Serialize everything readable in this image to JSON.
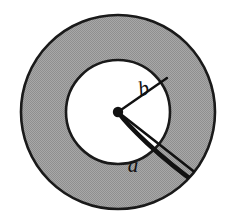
{
  "figure": {
    "name": "annulus-with-radial-crack",
    "background_color": "#ffffff",
    "ring_fill_color": "#9e9e9e",
    "inner_disc_color": "#ffffff",
    "outline_color": "#1a1a1a",
    "line_color": "#111111",
    "center_dot_color": "#111111"
  },
  "geometry": {
    "center": {
      "x": 118,
      "y": 112
    },
    "outer_radius": 97,
    "inner_radius": 52,
    "center_dot_radius": 5.2,
    "outer_stroke_width": 2.6,
    "inner_stroke_width": 2.6,
    "radius_line_stroke_width": 2.4,
    "crack_upper_stroke_width": 2.6,
    "crack_lower_stroke_width": 4.6
  },
  "elements": {
    "outer_circle": {
      "name": "outer-circle"
    },
    "inner_circle": {
      "name": "inner-circle"
    },
    "center_dot": {
      "name": "center-dot"
    },
    "radius_line_b": {
      "name": "radius-line-b",
      "from": {
        "x": 118,
        "y": 112
      },
      "to": {
        "x": 167,
        "y": 78
      }
    },
    "crack_upper_line": {
      "name": "crack-upper-edge",
      "from": {
        "x": 118,
        "y": 112
      },
      "to": {
        "x": 193,
        "y": 171
      }
    },
    "crack_lower_line": {
      "name": "crack-lower-edge",
      "from": {
        "x": 118,
        "y": 112
      },
      "to": {
        "x": 196,
        "y": 182
      }
    },
    "crack_tip": {
      "name": "crack-tip",
      "x": 195,
      "y": 178
    }
  },
  "labels": {
    "b": {
      "text": "b",
      "x": 145,
      "y": 95,
      "font_size": 21,
      "rotation": -14
    },
    "a": {
      "text": "a",
      "x": 133,
      "y": 172,
      "font_size": 21,
      "rotation": 0
    }
  }
}
